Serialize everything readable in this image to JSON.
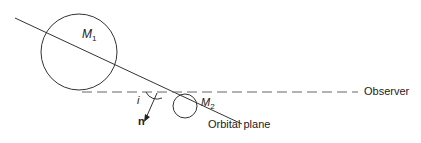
{
  "labels": {
    "m1": "M",
    "m1_sub": "1",
    "m2": "M",
    "m2_sub": "2",
    "angle": "i",
    "normal": "n",
    "orbital_plane": "Orbital plane",
    "observer": "Observer"
  },
  "colors": {
    "stroke": "#333333",
    "dash": "#555555"
  }
}
